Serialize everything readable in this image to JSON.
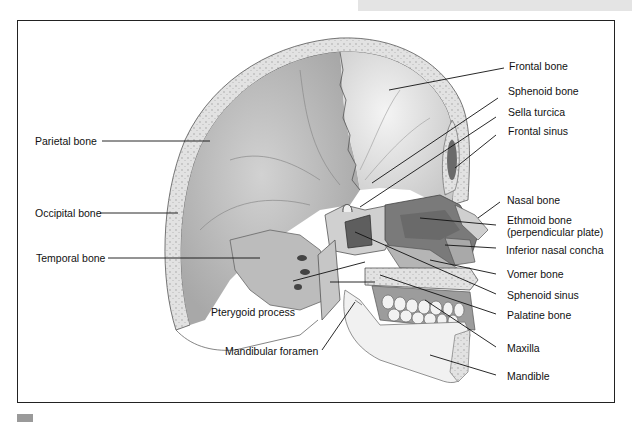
{
  "figure": {
    "colors": {
      "frame": "#222222",
      "bone_light": "#e8e8e8",
      "bone_mid": "#bdbdbd",
      "bone_dark": "#8a8a8a",
      "cavity": "#6e6e6e",
      "leader": "#111111",
      "top_tab": "#e4e4e4",
      "corner_square": "#9a9a9a"
    },
    "labels_left": [
      {
        "id": "parietal-bone",
        "text": "Parietal bone"
      },
      {
        "id": "occipital-bone",
        "text": "Occipital bone"
      },
      {
        "id": "temporal-bone",
        "text": "Temporal bone"
      },
      {
        "id": "pterygoid-process",
        "text": "Pterygoid process"
      },
      {
        "id": "mandibular-foramen",
        "text": "Mandibular foramen"
      }
    ],
    "labels_right": [
      {
        "id": "frontal-bone",
        "text": "Frontal bone"
      },
      {
        "id": "sphenoid-bone",
        "text": "Sphenoid bone"
      },
      {
        "id": "sella-turcica",
        "text": "Sella turcica"
      },
      {
        "id": "frontal-sinus",
        "text": "Frontal sinus"
      },
      {
        "id": "nasal-bone",
        "text": "Nasal bone"
      },
      {
        "id": "ethmoid-bone",
        "text": "Ethmoid bone",
        "text2": "(perpendicular plate)"
      },
      {
        "id": "inferior-nasal-concha",
        "text": "Inferior nasal concha"
      },
      {
        "id": "vomer-bone",
        "text": "Vomer bone"
      },
      {
        "id": "sphenoid-sinus",
        "text": "Sphenoid sinus"
      },
      {
        "id": "palatine-bone",
        "text": "Palatine bone"
      },
      {
        "id": "maxilla",
        "text": "Maxilla"
      },
      {
        "id": "mandible",
        "text": "Mandible"
      }
    ]
  }
}
